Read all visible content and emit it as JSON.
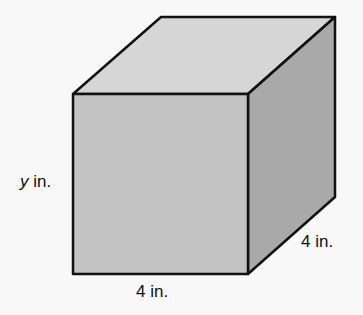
{
  "diagram": {
    "type": "rectangular-prism",
    "labels": {
      "height": {
        "variable": "y",
        "unit": " in."
      },
      "width": "4 in.",
      "depth": "4 in."
    },
    "colors": {
      "top_face": "#d6d6d6",
      "front_face": "#c2c2c2",
      "side_face": "#a9a9a9",
      "edge": "#111111",
      "background": "#f8f8f8"
    }
  }
}
